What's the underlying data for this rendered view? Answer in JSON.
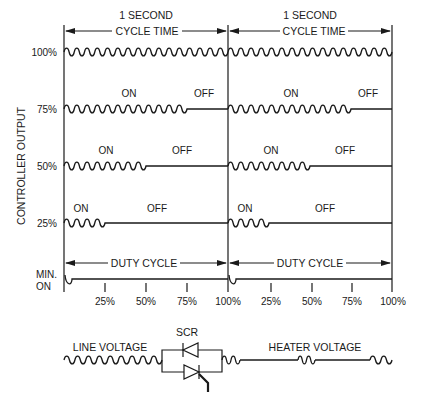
{
  "diagram": {
    "header_labels": [
      "1 SECOND",
      "1 SECOND"
    ],
    "cycle_time_labels": [
      "CYCLE TIME",
      "CYCLE TIME"
    ],
    "y_axis_title": "CONTROLLER OUTPUT",
    "rows": [
      {
        "label": "100%",
        "duty": 1.0,
        "on_label": "",
        "off_label": ""
      },
      {
        "label": "75%",
        "duty": 0.75,
        "on_label": "ON",
        "off_label": "OFF"
      },
      {
        "label": "50%",
        "duty": 0.5,
        "on_label": "ON",
        "off_label": "OFF"
      },
      {
        "label": "25%",
        "duty": 0.25,
        "on_label": "ON",
        "off_label": "OFF"
      },
      {
        "label_line1": "MIN.",
        "label_line2": "ON",
        "duty": 0.02
      }
    ],
    "duty_cycle_labels": [
      "DUTY CYCLE",
      "DUTY CYCLE"
    ],
    "tick_labels": [
      "25%",
      "50%",
      "75%",
      "100%",
      "25%",
      "50%",
      "75%",
      "100%"
    ],
    "cycles_per_second": 16
  },
  "circuit": {
    "line_voltage_label": "LINE VOLTAGE",
    "scr_label": "SCR",
    "heater_voltage_label": "HEATER VOLTAGE"
  }
}
